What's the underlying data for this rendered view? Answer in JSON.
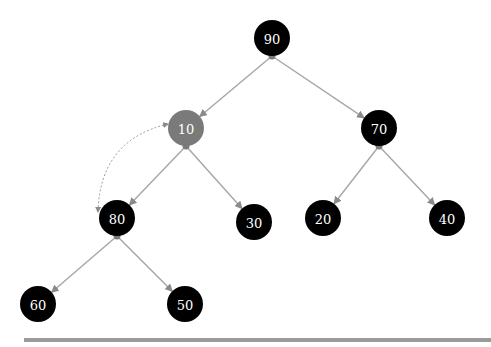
{
  "diagram": {
    "type": "binary-tree",
    "colors": {
      "node_default": "#000000",
      "node_highlight": "#7a7a7a",
      "edge": "#a6a6a6",
      "label": "#ffffff"
    },
    "nodes": [
      {
        "id": "n90",
        "label": "90",
        "x": 272,
        "y": 38,
        "highlight": false
      },
      {
        "id": "n10",
        "label": "10",
        "x": 186,
        "y": 128,
        "highlight": true
      },
      {
        "id": "n70",
        "label": "70",
        "x": 379,
        "y": 128,
        "highlight": false
      },
      {
        "id": "n80",
        "label": "80",
        "x": 117,
        "y": 218,
        "highlight": false
      },
      {
        "id": "n30",
        "label": "30",
        "x": 254,
        "y": 222,
        "highlight": false
      },
      {
        "id": "n20",
        "label": "20",
        "x": 323,
        "y": 218,
        "highlight": false
      },
      {
        "id": "n40",
        "label": "40",
        "x": 447,
        "y": 218,
        "highlight": false
      },
      {
        "id": "n60",
        "label": "60",
        "x": 38,
        "y": 304,
        "highlight": false
      },
      {
        "id": "n50",
        "label": "50",
        "x": 185,
        "y": 304,
        "highlight": false
      }
    ],
    "edges": [
      {
        "from": "n90",
        "to": "n10"
      },
      {
        "from": "n90",
        "to": "n70"
      },
      {
        "from": "n10",
        "to": "n80"
      },
      {
        "from": "n10",
        "to": "n30"
      },
      {
        "from": "n70",
        "to": "n20"
      },
      {
        "from": "n70",
        "to": "n40"
      },
      {
        "from": "n80",
        "to": "n60"
      },
      {
        "from": "n80",
        "to": "n50"
      }
    ],
    "swap_link": {
      "from": "n10",
      "to": "n80",
      "style": "dotted-curve",
      "bidirectional": true
    }
  }
}
